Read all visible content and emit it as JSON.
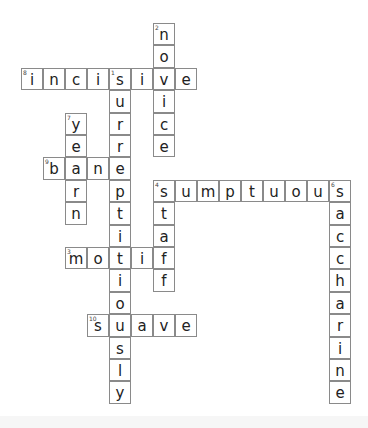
{
  "puzzle": {
    "grid": {
      "origin_x": 21,
      "origin_y": 23,
      "cell_w": 22,
      "cell_h": 22.4
    },
    "words": [
      {
        "number": 1,
        "answer": "surreptitiously",
        "direction": "down",
        "row": 2,
        "col": 4
      },
      {
        "number": 2,
        "answer": "novice",
        "direction": "down",
        "row": 0,
        "col": 6
      },
      {
        "number": 3,
        "answer": "motif",
        "direction": "across",
        "row": 10,
        "col": 2
      },
      {
        "number": 4,
        "answer": "sumptuous",
        "direction": "across",
        "row": 7,
        "col": 6
      },
      {
        "number": 4,
        "answer": "staff",
        "direction": "down",
        "row": 7,
        "col": 6
      },
      {
        "number": 6,
        "answer": "saccharine",
        "direction": "down",
        "row": 7,
        "col": 14
      },
      {
        "number": 7,
        "answer": "yearn",
        "direction": "down",
        "row": 4,
        "col": 2
      },
      {
        "number": 8,
        "answer": "incisive",
        "direction": "across",
        "row": 2,
        "col": 0
      },
      {
        "number": 9,
        "answer": "bane",
        "direction": "across",
        "row": 6,
        "col": 1
      },
      {
        "number": 10,
        "answer": "suave",
        "direction": "across",
        "row": 13,
        "col": 3
      }
    ]
  }
}
